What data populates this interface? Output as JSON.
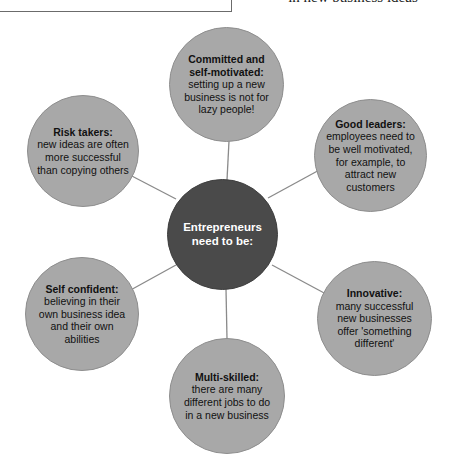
{
  "page": {
    "header_caption": "in new business ideas"
  },
  "diagram": {
    "hub": {
      "label": "Entrepreneurs need to be:",
      "color": "#4a4a4a",
      "text_color": "#ffffff"
    },
    "satellite_color": "#a8a8a8",
    "connector_color": "#8a8a8a",
    "nodes": [
      {
        "id": "committed",
        "heading": "Committed and self-motivated:",
        "body": "setting up a new business is not for lazy people!"
      },
      {
        "id": "good-leaders",
        "heading": "Good leaders:",
        "body": "employees need to be well motivated, for example, to attract new customers"
      },
      {
        "id": "innovative",
        "heading": "Innovative:",
        "body": "many successful new businesses offer 'something different'"
      },
      {
        "id": "multi-skilled",
        "heading": "Multi-skilled:",
        "body": "there are many different jobs to do in a new business"
      },
      {
        "id": "self-confident",
        "heading": "Self confident:",
        "body": "believing in their own business idea and their own abilities"
      },
      {
        "id": "risk-takers",
        "heading": "Risk takers:",
        "body": "new ideas are often more successful than copying others"
      }
    ]
  }
}
